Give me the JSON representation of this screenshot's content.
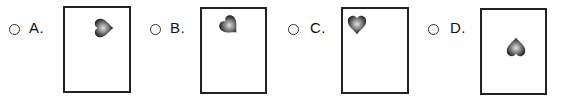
{
  "question": {
    "options": [
      {
        "letter": "A.",
        "radio_selected": false,
        "heart": {
          "rotation_deg": -90,
          "position": "top-right"
        }
      },
      {
        "letter": "B.",
        "radio_selected": false,
        "heart": {
          "rotation_deg": -45,
          "position": "top-left"
        }
      },
      {
        "letter": "C.",
        "radio_selected": false,
        "heart": {
          "rotation_deg": 0,
          "position": "top-left"
        }
      },
      {
        "letter": "D.",
        "radio_selected": false,
        "heart": {
          "rotation_deg": 180,
          "position": "center"
        }
      }
    ]
  },
  "colors": {
    "frame_border": "#222222",
    "heart_dark": "#1a1a1a",
    "heart_light": "#d8d8d8",
    "text": "#111111"
  }
}
